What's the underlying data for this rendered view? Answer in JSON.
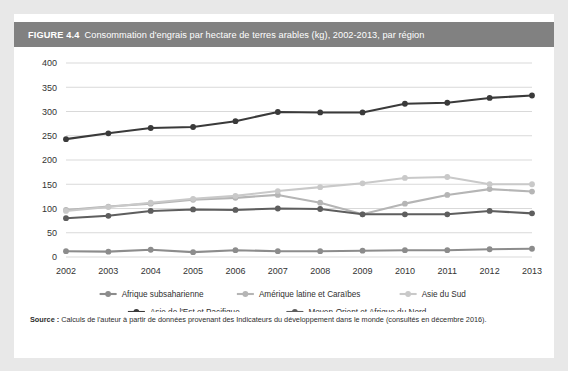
{
  "figure": {
    "number": "FIGURE 4.4",
    "title": "Consommation d'engrais par hectare de terres arables (kg), 2002-2013, par région"
  },
  "source": {
    "label": "Source :",
    "text": " Calculs de l'auteur à partir de données provenant des Indicateurs du développement dans le monde (consultés en décembre 2016)."
  },
  "colors": {
    "header_bg": "#818181",
    "card_bg": "#ffffff",
    "page_bg": "#e8e8e8",
    "grid": "#d9d9d9",
    "series_sub_saharan": "#8c8c8c",
    "series_latin_america": "#b5b5b5",
    "series_south_asia": "#c9c9c9",
    "series_east_asia": "#3a3a3a",
    "series_mena": "#5e5e5e"
  },
  "chart_data": {
    "type": "line",
    "title": "Consommation d'engrais par hectare de terres arables (kg), 2002-2013, par région",
    "xlabel": "",
    "ylabel": "",
    "ylim": [
      0,
      400
    ],
    "ytick_step": 50,
    "grid": true,
    "legend_position": "bottom",
    "categories": [
      "2002",
      "2003",
      "2004",
      "2005",
      "2006",
      "2007",
      "2008",
      "2009",
      "2010",
      "2011",
      "2012",
      "2013"
    ],
    "yticks": [
      "0",
      "50",
      "100",
      "150",
      "200",
      "250",
      "300",
      "350",
      "400"
    ],
    "series": [
      {
        "name": "Afrique subsaharienne",
        "color": "#8c8c8c",
        "values": [
          12,
          11,
          15,
          10,
          14,
          12,
          12,
          13,
          14,
          14,
          16,
          17
        ]
      },
      {
        "name": "Amérique latine et Caraïbes",
        "color": "#b5b5b5",
        "values": [
          97,
          104,
          110,
          118,
          122,
          128,
          112,
          88,
          110,
          128,
          140,
          135
        ]
      },
      {
        "name": "Asie du Sud",
        "color": "#c9c9c9",
        "values": [
          95,
          103,
          112,
          120,
          126,
          136,
          144,
          152,
          163,
          165,
          150,
          150
        ]
      },
      {
        "name": "Asie de l'Est et Pacifique",
        "color": "#3a3a3a",
        "values": [
          243,
          255,
          266,
          268,
          280,
          299,
          298,
          298,
          316,
          318,
          328,
          333
        ]
      },
      {
        "name": "Moyen-Orient et Afrique du Nord",
        "color": "#5e5e5e",
        "values": [
          80,
          85,
          95,
          98,
          97,
          100,
          99,
          88,
          88,
          88,
          95,
          90
        ]
      }
    ]
  }
}
